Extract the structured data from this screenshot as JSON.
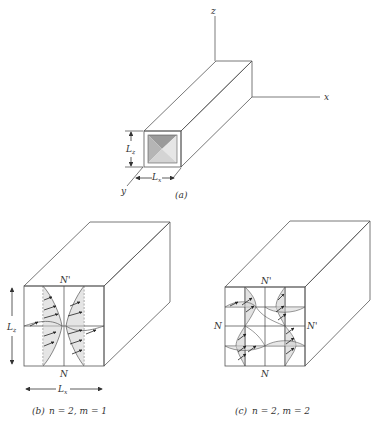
{
  "figure": {
    "panel_a": {
      "caption": "(a)",
      "axes": {
        "z": "z",
        "x": "x",
        "y": "y"
      },
      "dimensions": {
        "height": "L",
        "height_sub": "z",
        "width": "L",
        "width_sub": "x"
      }
    },
    "panel_b": {
      "caption_prefix": "(b)",
      "caption_text": "n = 2, m = 1",
      "node_top": "N'",
      "node_bottom": "N",
      "dim_vertical": "L",
      "dim_vertical_sub": "z",
      "dim_horizontal": "L",
      "dim_horizontal_sub": "x"
    },
    "panel_c": {
      "caption_prefix": "(c)",
      "caption_text": "n = 2, m = 2",
      "node_top": "N'",
      "node_bottom": "N",
      "node_left": "N",
      "node_right": "N'"
    }
  },
  "colors": {
    "background": "#ffffff",
    "face_front": "#e9e9e9",
    "face_top": "#efefef",
    "face_side": "#d3d3d3",
    "line": "#444444"
  }
}
